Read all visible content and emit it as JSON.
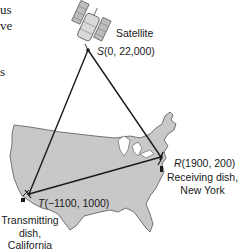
{
  "figure": {
    "left_text_fragments": [
      "us",
      "ve",
      "s"
    ],
    "satellite": {
      "name": "Satellite",
      "point_letter": "S",
      "coords": "(0, 22,000)",
      "x": 0,
      "y": 22000
    },
    "transmitter": {
      "point_letter": "T",
      "coords": "(−1100, 1000)",
      "x": -1100,
      "y": 1000,
      "caption_lines": [
        "Transmitting",
        "dish,",
        "California"
      ]
    },
    "receiver": {
      "point_letter": "R",
      "coords": "(1900, 200)",
      "x": 1900,
      "y": 200,
      "caption_lines": [
        "Receiving dish,",
        "New York"
      ]
    },
    "colors": {
      "map_fill": "#c8c8c8",
      "map_stroke": "#555555",
      "line": "#1a1a1a",
      "text": "#1a1a1a"
    }
  }
}
